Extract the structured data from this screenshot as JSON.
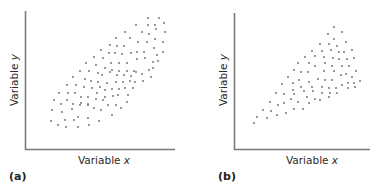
{
  "chart_data": [
    {
      "type": "scatter",
      "panel_label": "(a)",
      "title": "",
      "xlabel": "Variable x",
      "ylabel": "Variable y",
      "grid": false,
      "ticks": false,
      "legend": null,
      "description": "Positive correlation; points fill a wide parallelogram band from lower-left to upper-right (roughly constant spread)",
      "points_px": [
        [
          148,
          18
        ],
        [
          159,
          18
        ],
        [
          164,
          23
        ],
        [
          136,
          25
        ],
        [
          148,
          25
        ],
        [
          155,
          25
        ],
        [
          125,
          32
        ],
        [
          142,
          32
        ],
        [
          149,
          34
        ],
        [
          165,
          32
        ],
        [
          156,
          29
        ],
        [
          116,
          38
        ],
        [
          130,
          38
        ],
        [
          138,
          42
        ],
        [
          147,
          42
        ],
        [
          155,
          39
        ],
        [
          163,
          42
        ],
        [
          110,
          45
        ],
        [
          117,
          46
        ],
        [
          124,
          46
        ],
        [
          137,
          52
        ],
        [
          144,
          52
        ],
        [
          154,
          48
        ],
        [
          163,
          52
        ],
        [
          101,
          50
        ],
        [
          109,
          53
        ],
        [
          115,
          53
        ],
        [
          122,
          54
        ],
        [
          131,
          53
        ],
        [
          157,
          55
        ],
        [
          94,
          57
        ],
        [
          103,
          58
        ],
        [
          111,
          63
        ],
        [
          119,
          63
        ],
        [
          127,
          63
        ],
        [
          137,
          59
        ],
        [
          145,
          58
        ],
        [
          153,
          62
        ],
        [
          158,
          61
        ],
        [
          86,
          63
        ],
        [
          96,
          65
        ],
        [
          105,
          68
        ],
        [
          112,
          70
        ],
        [
          119,
          71
        ],
        [
          127,
          71
        ],
        [
          134,
          71
        ],
        [
          142,
          74
        ],
        [
          149,
          70
        ],
        [
          153,
          68
        ],
        [
          80,
          71
        ],
        [
          89,
          71
        ],
        [
          98,
          73
        ],
        [
          102,
          75
        ],
        [
          110,
          72
        ],
        [
          117,
          75
        ],
        [
          124,
          75
        ],
        [
          131,
          76
        ],
        [
          136,
          72
        ],
        [
          151,
          77
        ],
        [
          73,
          77
        ],
        [
          85,
          79
        ],
        [
          91,
          81
        ],
        [
          98,
          82
        ],
        [
          107,
          83
        ],
        [
          116,
          82
        ],
        [
          123,
          82
        ],
        [
          130,
          81
        ],
        [
          135,
          82
        ],
        [
          143,
          81
        ],
        [
          67,
          85
        ],
        [
          76,
          85
        ],
        [
          84,
          87
        ],
        [
          92,
          88
        ],
        [
          100,
          87
        ],
        [
          105,
          90
        ],
        [
          112,
          89
        ],
        [
          119,
          89
        ],
        [
          125,
          88
        ],
        [
          133,
          88
        ],
        [
          59,
          93
        ],
        [
          68,
          93
        ],
        [
          75,
          93
        ],
        [
          81,
          97
        ],
        [
          88,
          97
        ],
        [
          97,
          93
        ],
        [
          105,
          97
        ],
        [
          113,
          96
        ],
        [
          118,
          95
        ],
        [
          128,
          95
        ],
        [
          54,
          100
        ],
        [
          61,
          104
        ],
        [
          67,
          100
        ],
        [
          73,
          104
        ],
        [
          81,
          103
        ],
        [
          88,
          104
        ],
        [
          96,
          99
        ],
        [
          103,
          100
        ],
        [
          108,
          105
        ],
        [
          116,
          105
        ],
        [
          121,
          108
        ],
        [
          127,
          102
        ],
        [
          52,
          110
        ],
        [
          62,
          112
        ],
        [
          72,
          109
        ],
        [
          80,
          105
        ],
        [
          88,
          105
        ],
        [
          94,
          108
        ],
        [
          101,
          110
        ],
        [
          51,
          121
        ],
        [
          58,
          125
        ],
        [
          65,
          120
        ],
        [
          66,
          127
        ],
        [
          74,
          120
        ],
        [
          78,
          117
        ],
        [
          78,
          127
        ],
        [
          88,
          118
        ],
        [
          89,
          125
        ],
        [
          99,
          121
        ],
        [
          112,
          115
        ]
      ]
    },
    {
      "type": "scatter",
      "panel_label": "(b)",
      "title": "",
      "xlabel": "Variable x",
      "ylabel": "Variable y",
      "grid": false,
      "ticks": false,
      "legend": null,
      "description": "Positive correlation; points form a fan/wedge widening from lower-left toward upper-right (spread increases with x)",
      "points_px": [
        [
          334,
          27
        ],
        [
          328,
          34
        ],
        [
          342,
          32
        ],
        [
          334,
          39
        ],
        [
          320,
          44
        ],
        [
          329,
          44
        ],
        [
          337,
          46
        ],
        [
          346,
          42
        ],
        [
          312,
          51
        ],
        [
          322,
          51
        ],
        [
          331,
          50
        ],
        [
          339,
          52
        ],
        [
          352,
          50
        ],
        [
          344,
          52
        ],
        [
          305,
          57
        ],
        [
          315,
          56
        ],
        [
          324,
          57
        ],
        [
          333,
          58
        ],
        [
          339,
          59
        ],
        [
          347,
          59
        ],
        [
          354,
          58
        ],
        [
          298,
          63
        ],
        [
          309,
          63
        ],
        [
          315,
          66
        ],
        [
          325,
          63
        ],
        [
          332,
          66
        ],
        [
          342,
          66
        ],
        [
          349,
          66
        ],
        [
          356,
          71
        ],
        [
          294,
          70
        ],
        [
          301,
          72
        ],
        [
          308,
          72
        ],
        [
          324,
          71
        ],
        [
          334,
          71
        ],
        [
          341,
          75
        ],
        [
          346,
          74
        ],
        [
          352,
          77
        ],
        [
          360,
          81
        ],
        [
          288,
          77
        ],
        [
          299,
          80
        ],
        [
          318,
          79
        ],
        [
          325,
          80
        ],
        [
          332,
          80
        ],
        [
          342,
          85
        ],
        [
          348,
          83
        ],
        [
          354,
          83
        ],
        [
          282,
          84
        ],
        [
          293,
          83
        ],
        [
          301,
          87
        ],
        [
          309,
          82
        ],
        [
          312,
          87
        ],
        [
          322,
          87
        ],
        [
          329,
          88
        ],
        [
          336,
          88
        ],
        [
          348,
          88
        ],
        [
          355,
          87
        ],
        [
          276,
          93
        ],
        [
          284,
          94
        ],
        [
          293,
          90
        ],
        [
          294,
          94
        ],
        [
          304,
          91
        ],
        [
          313,
          91
        ],
        [
          322,
          93
        ],
        [
          330,
          93
        ],
        [
          337,
          93
        ],
        [
          270,
          102
        ],
        [
          278,
          105
        ],
        [
          284,
          103
        ],
        [
          291,
          99
        ],
        [
          298,
          102
        ],
        [
          307,
          97
        ],
        [
          315,
          99
        ],
        [
          320,
          100
        ],
        [
          329,
          97
        ],
        [
          263,
          110
        ],
        [
          271,
          111
        ],
        [
          277,
          115
        ],
        [
          286,
          113
        ],
        [
          294,
          109
        ],
        [
          303,
          109
        ],
        [
          309,
          103
        ],
        [
          257,
          117
        ],
        [
          267,
          118
        ],
        [
          254,
          123
        ]
      ]
    }
  ],
  "panels": {
    "a": {
      "tag": "(a)",
      "xlabel_main": "Variable ",
      "xlabel_var": "x",
      "ylabel_main": "Variable ",
      "ylabel_var": "y"
    },
    "b": {
      "tag": "(b)",
      "xlabel_main": "Variable ",
      "xlabel_var": "x",
      "ylabel_main": "Variable ",
      "ylabel_var": "y"
    }
  },
  "colors": {
    "axis": "#7a7a7a",
    "dot": "#6a6a6a",
    "text": "#2b2b2b"
  }
}
